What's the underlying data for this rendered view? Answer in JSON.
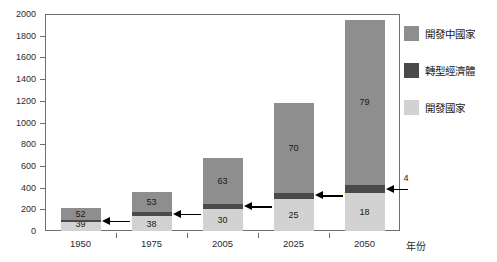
{
  "chart_data": {
    "type": "bar",
    "subtype": "stacked-bar",
    "title": "",
    "xlabel": "年份",
    "ylabel": "",
    "ylim": [
      0,
      2000
    ],
    "ytick_step": 200,
    "grid": false,
    "legend_position": "right",
    "categories": [
      "1950",
      "1975",
      "2005",
      "2025",
      "2050"
    ],
    "ytick_labels": [
      "0",
      "200",
      "400",
      "600",
      "800",
      "1000",
      "1200",
      "1400",
      "1600",
      "1800",
      "2000"
    ],
    "series": [
      {
        "name": "開發國家",
        "color": "#d2d2d2",
        "values": [
          82,
          137,
          201,
          295,
          347
        ],
        "percent_labels": [
          "39",
          "38",
          "30",
          "25",
          "18"
        ]
      },
      {
        "name": "轉型經濟體",
        "color": "#4a4a4a",
        "values": [
          19,
          36,
          47,
          59,
          77
        ],
        "percent_labels": [
          "9",
          "10",
          "7",
          "5",
          "4"
        ]
      },
      {
        "name": "開發中國家",
        "color": "#8e8e8e",
        "values": [
          109,
          191,
          422,
          826,
          1525
        ],
        "percent_labels": [
          "52",
          "53",
          "63",
          "70",
          "79"
        ]
      }
    ],
    "totals": [
      210,
      364,
      670,
      1180,
      1930
    ],
    "annotations": [
      {
        "category": "1950",
        "series": "轉型經濟體",
        "text": "9"
      },
      {
        "category": "1975",
        "series": "轉型經濟體",
        "text": "10"
      },
      {
        "category": "2005",
        "series": "轉型經濟體",
        "text": "7"
      },
      {
        "category": "2025",
        "series": "轉型經濟體",
        "text": "5"
      },
      {
        "category": "2050",
        "series": "轉型經濟體",
        "text": "4"
      }
    ]
  },
  "legend": {
    "items": [
      {
        "label": "開發中國家",
        "color": "#8e8e8e"
      },
      {
        "label": "轉型經濟體",
        "color": "#4a4a4a"
      },
      {
        "label": "開發國家",
        "color": "#d2d2d2"
      }
    ]
  },
  "axes": {
    "x_title": "年份",
    "y_ticks": [
      "2000",
      "1800",
      "1600",
      "1400",
      "1200",
      "1000",
      "800",
      "600",
      "400",
      "200",
      "0"
    ],
    "x_ticks": [
      "1950",
      "1975",
      "2005",
      "2025",
      "2050"
    ]
  },
  "bars": [
    {
      "category": "1950",
      "developing_label": "52",
      "transition_label": "9",
      "developed_label": "39"
    },
    {
      "category": "1975",
      "developing_label": "53",
      "transition_label": "10",
      "developed_label": "38"
    },
    {
      "category": "2005",
      "developing_label": "63",
      "transition_label": "7",
      "developed_label": "30"
    },
    {
      "category": "2025",
      "developing_label": "70",
      "transition_label": "5",
      "developed_label": "25"
    },
    {
      "category": "2050",
      "developing_label": "79",
      "transition_label": "4",
      "developed_label": "18"
    }
  ]
}
